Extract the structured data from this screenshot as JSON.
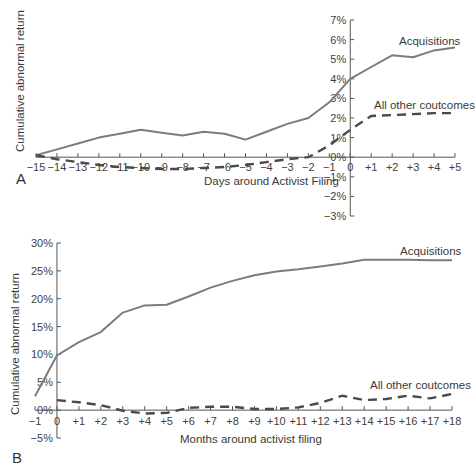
{
  "chart_data": [
    {
      "panel": "A",
      "type": "line",
      "title": "",
      "xlabel": "Days around Activist Filing",
      "ylabel": "Cumulative abnormal return",
      "x": [
        -15,
        -14,
        -13,
        -12,
        -11,
        -10,
        -9,
        -8,
        -7,
        -6,
        -5,
        -4,
        -3,
        -2,
        -1,
        0,
        1,
        2,
        3,
        4,
        5
      ],
      "x_tick_labels": [
        "−15",
        "−14",
        "−13",
        "−12",
        "−11",
        "−10",
        "−9",
        "−8",
        "−7",
        "−6",
        "−5",
        "−4",
        "−3",
        "−2",
        "−1",
        "0",
        "+1",
        "+2",
        "+3",
        "+4",
        "+5"
      ],
      "y_tick_labels": [
        "7%",
        "6%",
        "5%",
        "4%",
        "3%",
        "2%",
        "1%",
        "0%",
        "−1%",
        "−2%",
        "−3%"
      ],
      "ylim": [
        -3,
        7
      ],
      "xlim": [
        -15,
        5
      ],
      "grid": false,
      "series": [
        {
          "name": "Acquisitions",
          "style": "solid",
          "values": [
            0.1,
            0.4,
            0.7,
            1.0,
            1.2,
            1.4,
            1.25,
            1.1,
            1.3,
            1.2,
            0.9,
            1.3,
            1.7,
            2.0,
            2.8,
            4.0,
            4.6,
            5.2,
            5.1,
            5.45,
            5.6
          ]
        },
        {
          "name": "All other coutcomes",
          "style": "dashed",
          "values": [
            0.1,
            -0.1,
            -0.25,
            -0.4,
            -0.5,
            -0.55,
            -0.6,
            -0.6,
            -0.55,
            -0.5,
            -0.4,
            -0.25,
            -0.1,
            0.0,
            0.6,
            1.4,
            2.1,
            2.15,
            2.2,
            2.25,
            2.25
          ]
        }
      ]
    },
    {
      "panel": "B",
      "type": "line",
      "title": "",
      "xlabel": "Months around activist filing",
      "ylabel": "Cumulative abnormal return",
      "x": [
        -1,
        0,
        1,
        2,
        3,
        4,
        5,
        6,
        7,
        8,
        9,
        10,
        11,
        12,
        13,
        14,
        15,
        16,
        17,
        18
      ],
      "x_tick_labels": [
        "−1",
        "0",
        "+1",
        "+2",
        "+3",
        "+4",
        "+5",
        "+6",
        "+7",
        "+8",
        "+9",
        "+10",
        "+11",
        "+12",
        "+13",
        "+14",
        "+15",
        "+16",
        "+17",
        "+18"
      ],
      "y_tick_labels": [
        "30%",
        "25%",
        "20%",
        "15%",
        "10%",
        "5%",
        "0%",
        "−5%"
      ],
      "ylim": [
        -5,
        30
      ],
      "xlim": [
        -1,
        18
      ],
      "grid": false,
      "series": [
        {
          "name": "Acquisitions",
          "style": "solid",
          "values": [
            2.5,
            9.8,
            12.2,
            14.0,
            17.5,
            18.8,
            18.9,
            20.4,
            22.0,
            23.2,
            24.2,
            24.9,
            25.3,
            25.8,
            26.3,
            27.0,
            27.0,
            27.0,
            26.9,
            26.9
          ]
        },
        {
          "name": "All other coutcomes",
          "style": "dashed",
          "values": [
            null,
            1.8,
            1.4,
            0.9,
            -0.1,
            -0.6,
            -0.5,
            0.4,
            0.6,
            0.6,
            0.2,
            0.2,
            0.5,
            1.3,
            2.6,
            1.8,
            2.0,
            2.6,
            2.1,
            2.9
          ]
        }
      ]
    }
  ],
  "labels": {
    "panel_a": "A",
    "panel_b": "B",
    "a_ylabel": "Cumulative abnormal return",
    "a_xlabel": "Days around Activist Filing",
    "a_series_acq": "Acquisitions",
    "a_series_other": "All other coutcomes",
    "b_ylabel": "Cumulative abnormal return",
    "b_xlabel": "Months around activist filing",
    "b_series_acq": "Acquisitions",
    "b_series_other": "All other coutcomes"
  }
}
